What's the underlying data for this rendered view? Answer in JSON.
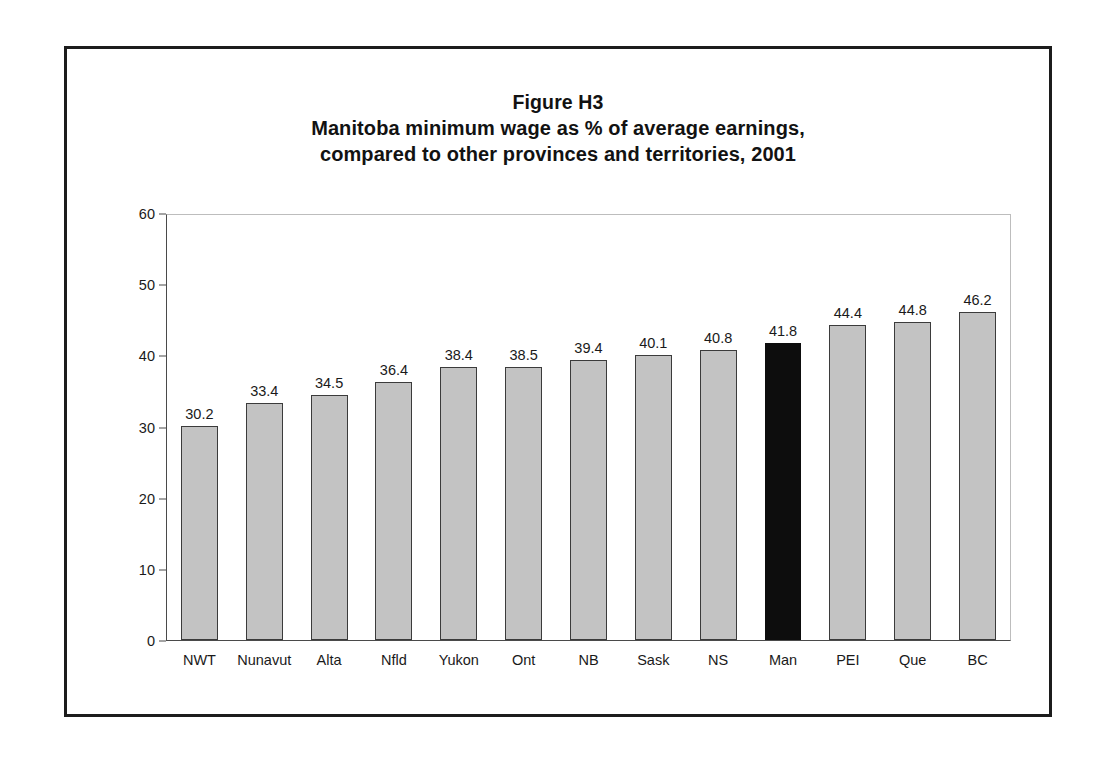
{
  "figure": {
    "frame_color": "#1c1c1c",
    "background": "#ffffff"
  },
  "title": {
    "line1": "Figure H3",
    "line2": "Manitoba minimum wage as % of average earnings,",
    "line3": "compared to other provinces and territories, 2001"
  },
  "axes": {
    "y_ticks": [
      "60",
      "50",
      "40",
      "30",
      "20",
      "10",
      "0"
    ],
    "y_min": 0,
    "y_max": 60,
    "y_step": 10
  },
  "colors": {
    "bar_fill": "#c3c3c3",
    "bar_outline": "#3b3b3b",
    "highlight_fill": "#0d0d0d",
    "axis_line": "#4a4a4a",
    "grid_line": "#bdbdbd",
    "text": "#1a1a1a"
  },
  "chart_data": {
    "type": "bar",
    "xlabel": "",
    "ylabel": "",
    "ylim": [
      0,
      60
    ],
    "yticks": [
      0,
      10,
      20,
      30,
      40,
      50,
      60
    ],
    "grid": false,
    "legend": false,
    "highlight_category": "Man",
    "categories": [
      "NWT",
      "Nunavut",
      "Alta",
      "Nfld",
      "Yukon",
      "Ont",
      "NB",
      "Sask",
      "NS",
      "Man",
      "PEI",
      "Que",
      "BC"
    ],
    "values": [
      30.2,
      33.4,
      34.5,
      36.4,
      38.4,
      38.5,
      39.4,
      40.1,
      40.8,
      41.8,
      44.4,
      44.8,
      46.2
    ],
    "value_labels": [
      "30.2",
      "33.4",
      "34.5",
      "36.4",
      "38.4",
      "38.5",
      "39.4",
      "40.1",
      "40.8",
      "41.8",
      "44.4",
      "44.8",
      "46.2"
    ],
    "bars": [
      {
        "category": "NWT",
        "value": 30.2,
        "label": "30.2",
        "highlight": false
      },
      {
        "category": "Nunavut",
        "value": 33.4,
        "label": "33.4",
        "highlight": false
      },
      {
        "category": "Alta",
        "value": 34.5,
        "label": "34.5",
        "highlight": false
      },
      {
        "category": "Nfld",
        "value": 36.4,
        "label": "36.4",
        "highlight": false
      },
      {
        "category": "Yukon",
        "value": 38.4,
        "label": "38.4",
        "highlight": false
      },
      {
        "category": "Ont",
        "value": 38.5,
        "label": "38.5",
        "highlight": false
      },
      {
        "category": "NB",
        "value": 39.4,
        "label": "39.4",
        "highlight": false
      },
      {
        "category": "Sask",
        "value": 40.1,
        "label": "40.1",
        "highlight": false
      },
      {
        "category": "NS",
        "value": 40.8,
        "label": "40.8",
        "highlight": false
      },
      {
        "category": "Man",
        "value": 41.8,
        "label": "41.8",
        "highlight": true
      },
      {
        "category": "PEI",
        "value": 44.4,
        "label": "44.4",
        "highlight": false
      },
      {
        "category": "Que",
        "value": 44.8,
        "label": "44.8",
        "highlight": false
      },
      {
        "category": "BC",
        "value": 46.2,
        "label": "46.2",
        "highlight": false
      }
    ]
  }
}
